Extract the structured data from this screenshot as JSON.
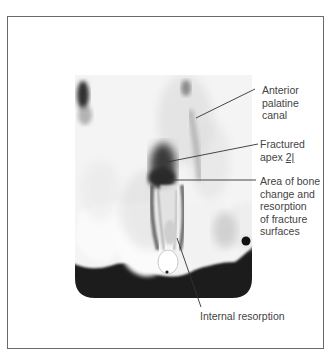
{
  "figure": {
    "labels": [
      {
        "id": "anterior-palatine-canal",
        "lines": [
          "Anterior",
          "palatine",
          "canal"
        ]
      },
      {
        "id": "fractured-apex",
        "lines": [
          "Fractured",
          "apex "
        ],
        "notation": "2|"
      },
      {
        "id": "bone-change",
        "lines": [
          "Area of bone",
          "change and",
          "resorption",
          "of fracture",
          "surfaces"
        ]
      },
      {
        "id": "internal-resorption",
        "lines": [
          "Internal resorption"
        ]
      }
    ]
  }
}
